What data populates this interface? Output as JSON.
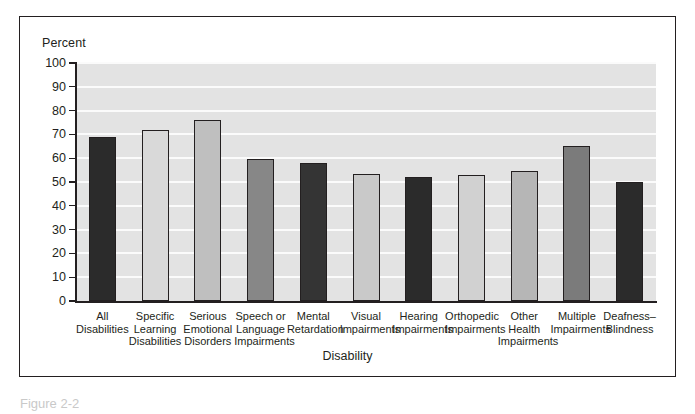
{
  "figure": {
    "y_axis_title": "Percent",
    "x_axis_title": "Disability",
    "caption": "Figure 2-2"
  },
  "colors": {
    "frame": "#231f20",
    "panel": "#e9e9e9",
    "plot_bg": "#e3e3e3",
    "gridline": "#fbfbfb",
    "text": "#231f20"
  },
  "chart_data": {
    "type": "bar",
    "title": "",
    "xlabel": "Disability",
    "ylabel": "Percent",
    "ylim": [
      0,
      100
    ],
    "yticks": [
      0,
      10,
      20,
      30,
      40,
      50,
      60,
      70,
      80,
      90,
      100
    ],
    "grid": true,
    "legend": "none",
    "categories": [
      "All Disabilities",
      "Specific Learning Disabilities",
      "Serious Emotional Disorders",
      "Speech or Language Impairments",
      "Mental Retardation",
      "Visual Impairments",
      "Hearing Impairments",
      "Orthopedic Impairments",
      "Other Health Impairments",
      "Multiple Impairments",
      "Deafness-Blindness"
    ],
    "category_lines": [
      [
        "All",
        "Disabilities"
      ],
      [
        "Specific",
        "Learning",
        "Disabilities"
      ],
      [
        "Serious",
        "Emotional",
        "Disorders"
      ],
      [
        "Speech or",
        "Language",
        "Impairments"
      ],
      [
        "Mental",
        "Retardation"
      ],
      [
        "Visual",
        "Impairments"
      ],
      [
        "Hearing",
        "Impairments"
      ],
      [
        "Orthopedic",
        "Impairments"
      ],
      [
        "Other",
        "Health",
        "Impairments"
      ],
      [
        "Multiple",
        "Impairments"
      ],
      [
        "Deafness–",
        "Blindness"
      ]
    ],
    "values": [
      69,
      72,
      76,
      59.5,
      58,
      53.5,
      52,
      53,
      54.5,
      65,
      50
    ],
    "bar_colors": [
      "#2b2b2b",
      "#d9d9d9",
      "#bfbfbf",
      "#878787",
      "#343434",
      "#c9c9c9",
      "#2b2b2b",
      "#d1d1d1",
      "#b6b6b6",
      "#7b7b7b",
      "#2b2b2b"
    ]
  }
}
